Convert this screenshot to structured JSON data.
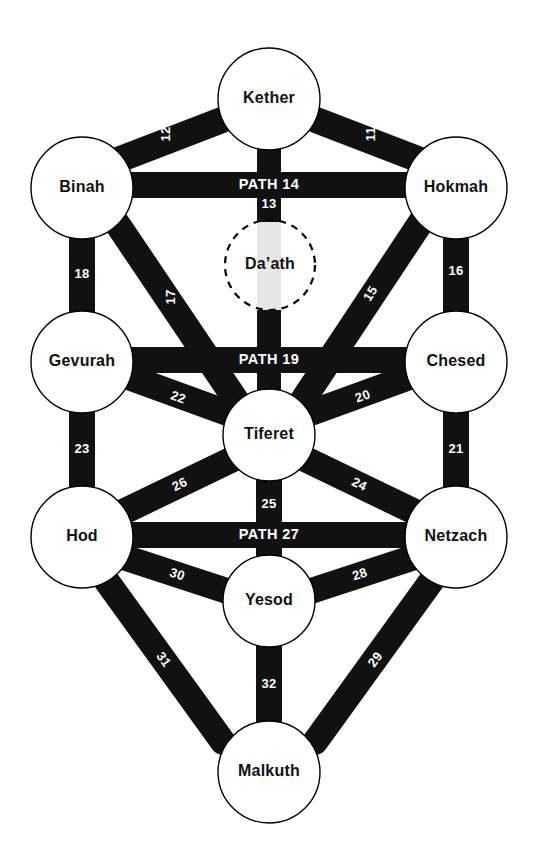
{
  "diagram": {
    "title": "Tree of Life",
    "background_color": "#ffffff",
    "path_color": "#111111",
    "node_fill": "#ffffff",
    "node_stroke": "#000000",
    "ghost_path_color": "#e6e6e6",
    "label_color": "#111111",
    "path_label_color": "#ffffff"
  },
  "sephiroth": [
    {
      "id": "kether",
      "label": "Kether",
      "cx": 269,
      "cy": 99,
      "r": 51,
      "dashed": false
    },
    {
      "id": "binah",
      "label": "Binah",
      "cx": 82,
      "cy": 188,
      "r": 51,
      "dashed": false
    },
    {
      "id": "hokmah",
      "label": "Hokmah",
      "cx": 456,
      "cy": 188,
      "r": 51,
      "dashed": false
    },
    {
      "id": "daath",
      "label": "Da’ath",
      "cx": 270,
      "cy": 265,
      "r": 45,
      "dashed": true
    },
    {
      "id": "gevurah",
      "label": "Gevurah",
      "cx": 82,
      "cy": 362,
      "r": 51,
      "dashed": false
    },
    {
      "id": "chesed",
      "label": "Chesed",
      "cx": 456,
      "cy": 362,
      "r": 51,
      "dashed": false
    },
    {
      "id": "tiferet",
      "label": "Tiferet",
      "cx": 269,
      "cy": 435,
      "r": 46,
      "dashed": false
    },
    {
      "id": "hod",
      "label": "Hod",
      "cx": 82,
      "cy": 537,
      "r": 51,
      "dashed": false
    },
    {
      "id": "netzach",
      "label": "Netzach",
      "cx": 456,
      "cy": 537,
      "r": 51,
      "dashed": false
    },
    {
      "id": "yesod",
      "label": "Yesod",
      "cx": 269,
      "cy": 601,
      "r": 46,
      "dashed": false
    },
    {
      "id": "malkuth",
      "label": "Malkuth",
      "cx": 269,
      "cy": 772,
      "r": 51,
      "dashed": false
    }
  ],
  "paths": [
    {
      "number": "11",
      "label": "11",
      "from": "kether",
      "to": "hokmah",
      "x1": 316,
      "y1": 120,
      "x2": 420,
      "y2": 160,
      "width": 26,
      "label_x": 372,
      "label_y": 134,
      "label_rot": -90,
      "style": "number"
    },
    {
      "number": "12",
      "label": "12",
      "from": "kether",
      "to": "binah",
      "x1": 222,
      "y1": 120,
      "x2": 118,
      "y2": 160,
      "width": 26,
      "label_x": 167,
      "label_y": 134,
      "label_rot": -90,
      "style": "number"
    },
    {
      "number": "13",
      "label": "13",
      "from": "kether",
      "to": "tiferet",
      "x1": 269,
      "y1": 143,
      "x2": 269,
      "y2": 400,
      "width": 24,
      "label_x": 269,
      "label_y": 205,
      "label_rot": 0,
      "style": "number",
      "ghost_from_y": 222,
      "ghost_to_y": 310
    },
    {
      "number": "14",
      "label": "PATH 14",
      "from": "binah",
      "to": "hokmah",
      "x1": 128,
      "y1": 185,
      "x2": 410,
      "y2": 185,
      "width": 26,
      "label_x": 269,
      "label_y": 185,
      "label_rot": 0,
      "style": "name"
    },
    {
      "number": "15",
      "label": "15",
      "from": "hokmah",
      "to": "tiferet",
      "x1": 423,
      "y1": 219,
      "x2": 303,
      "y2": 400,
      "width": 26,
      "label_x": 371,
      "label_y": 294,
      "label_rot": -58,
      "style": "number"
    },
    {
      "number": "16",
      "label": "16",
      "from": "hokmah",
      "to": "chesed",
      "x1": 456,
      "y1": 234,
      "x2": 456,
      "y2": 317,
      "width": 26,
      "label_x": 456,
      "label_y": 272,
      "label_rot": 0,
      "style": "number"
    },
    {
      "number": "17",
      "label": "17",
      "from": "binah",
      "to": "tiferet",
      "x1": 114,
      "y1": 219,
      "x2": 236,
      "y2": 400,
      "width": 26,
      "label_x": 172,
      "label_y": 297,
      "label_rot": -90,
      "style": "number"
    },
    {
      "number": "18",
      "label": "18",
      "from": "binah",
      "to": "gevurah",
      "x1": 82,
      "y1": 234,
      "x2": 82,
      "y2": 317,
      "width": 26,
      "label_x": 82,
      "label_y": 275,
      "label_rot": 0,
      "style": "number"
    },
    {
      "number": "19",
      "label": "PATH 19",
      "from": "gevurah",
      "to": "chesed",
      "x1": 128,
      "y1": 360,
      "x2": 410,
      "y2": 360,
      "width": 26,
      "label_x": 269,
      "label_y": 360,
      "label_rot": 0,
      "style": "name"
    },
    {
      "number": "20",
      "label": "20",
      "from": "chesed",
      "to": "tiferet",
      "x1": 415,
      "y1": 375,
      "x2": 305,
      "y2": 415,
      "width": 26,
      "label_x": 363,
      "label_y": 397,
      "label_rot": -20,
      "style": "number"
    },
    {
      "number": "21",
      "label": "21",
      "from": "chesed",
      "to": "netzach",
      "x1": 456,
      "y1": 409,
      "x2": 456,
      "y2": 492,
      "width": 26,
      "label_x": 456,
      "label_y": 450,
      "label_rot": 0,
      "style": "number"
    },
    {
      "number": "22",
      "label": "22",
      "from": "gevurah",
      "to": "tiferet",
      "x1": 123,
      "y1": 375,
      "x2": 233,
      "y2": 415,
      "width": 26,
      "label_x": 178,
      "label_y": 398,
      "label_rot": 20,
      "style": "number"
    },
    {
      "number": "23",
      "label": "23",
      "from": "gevurah",
      "to": "hod",
      "x1": 82,
      "y1": 409,
      "x2": 82,
      "y2": 492,
      "width": 26,
      "label_x": 82,
      "label_y": 450,
      "label_rot": 0,
      "style": "number"
    },
    {
      "number": "24",
      "label": "24",
      "from": "tiferet",
      "to": "netzach",
      "x1": 303,
      "y1": 458,
      "x2": 415,
      "y2": 512,
      "width": 26,
      "label_x": 359,
      "label_y": 485,
      "label_rot": 26,
      "style": "number"
    },
    {
      "number": "25",
      "label": "25",
      "from": "tiferet",
      "to": "yesod",
      "x1": 269,
      "y1": 472,
      "x2": 269,
      "y2": 563,
      "width": 26,
      "label_x": 269,
      "label_y": 505,
      "label_rot": 0,
      "style": "number"
    },
    {
      "number": "26",
      "label": "26",
      "from": "tiferet",
      "to": "hod",
      "x1": 235,
      "y1": 458,
      "x2": 123,
      "y2": 512,
      "width": 26,
      "label_x": 180,
      "label_y": 485,
      "label_rot": -26,
      "style": "number"
    },
    {
      "number": "27",
      "label": "PATH 27",
      "from": "hod",
      "to": "netzach",
      "x1": 128,
      "y1": 535,
      "x2": 410,
      "y2": 535,
      "width": 26,
      "label_x": 269,
      "label_y": 535,
      "label_rot": 0,
      "style": "name"
    },
    {
      "number": "28",
      "label": "28",
      "from": "netzach",
      "to": "yesod",
      "x1": 415,
      "y1": 557,
      "x2": 308,
      "y2": 592,
      "width": 26,
      "label_x": 360,
      "label_y": 575,
      "label_rot": -18,
      "style": "number"
    },
    {
      "number": "29",
      "label": "29",
      "from": "netzach",
      "to": "malkuth",
      "x1": 435,
      "y1": 576,
      "x2": 315,
      "y2": 742,
      "width": 26,
      "label_x": 376,
      "label_y": 660,
      "label_rot": -54,
      "style": "number"
    },
    {
      "number": "30",
      "label": "30",
      "from": "hod",
      "to": "yesod",
      "x1": 123,
      "y1": 557,
      "x2": 230,
      "y2": 592,
      "width": 26,
      "label_x": 177,
      "label_y": 575,
      "label_rot": 18,
      "style": "number"
    },
    {
      "number": "31",
      "label": "31",
      "from": "hod",
      "to": "malkuth",
      "x1": 103,
      "y1": 576,
      "x2": 223,
      "y2": 742,
      "width": 26,
      "label_x": 163,
      "label_y": 660,
      "label_rot": 54,
      "style": "number"
    },
    {
      "number": "32",
      "label": "32",
      "from": "yesod",
      "to": "malkuth",
      "x1": 269,
      "y1": 639,
      "x2": 269,
      "y2": 735,
      "width": 26,
      "label_x": 269,
      "label_y": 685,
      "label_rot": 0,
      "style": "number"
    }
  ]
}
